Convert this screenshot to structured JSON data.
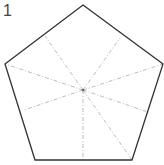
{
  "figure": {
    "label": "1",
    "shape": "pentagon",
    "outline_color": "#333333",
    "fold_line_color": "#aaaaaa",
    "center": [
      83,
      90
    ],
    "vertices": [
      [
        83,
        5
      ],
      [
        163,
        64
      ],
      [
        132,
        160
      ],
      [
        35,
        160
      ],
      [
        5,
        64
      ]
    ],
    "fold_lines": [
      [
        5,
        64
      ],
      [
        163,
        64
      ],
      [
        132,
        160
      ],
      [
        83,
        160
      ],
      [
        45,
        36
      ],
      [
        120,
        38
      ],
      [
        24,
        110
      ],
      [
        148,
        112
      ]
    ]
  }
}
